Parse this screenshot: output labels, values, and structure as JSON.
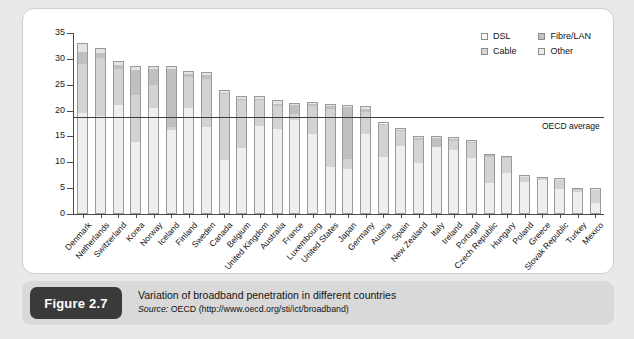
{
  "figure": {
    "badge": "Figure 2.7",
    "caption": "Variation of broadband penetration in different countries",
    "source_prefix": "Source: ",
    "source_text": "OECD (http://www.oecd.org/sti/ict/broadband)"
  },
  "legend": {
    "position": "top-right",
    "items": [
      {
        "label": "DSL",
        "key": "dsl",
        "color": "#fafafa"
      },
      {
        "label": "Fibre/LAN",
        "key": "fibre",
        "color": "#c2c2c2"
      },
      {
        "label": "Cable",
        "key": "cable",
        "color": "#d6d6d6"
      },
      {
        "label": "Other",
        "key": "other",
        "color": "#ededed"
      }
    ]
  },
  "annotations": {
    "oecd_average_label": "OECD average",
    "oecd_average_value": 18.7
  },
  "chart_data": {
    "type": "bar",
    "title": "Variation of broadband penetration in different countries",
    "subtitle": "Source: OECD (http://www.oecd.org/sti/ict/broadband)",
    "xlabel": "",
    "ylabel": "",
    "ylim": [
      0,
      35
    ],
    "yticks": [
      0,
      5,
      10,
      15,
      20,
      25,
      30,
      35
    ],
    "ytick_labels": [
      "0",
      "5",
      "10",
      "15",
      "20",
      "25",
      "30",
      "35"
    ],
    "grid": false,
    "stacked": true,
    "legend_position": "top-right",
    "categories": [
      "Denmark",
      "Netherlands",
      "Switzerland",
      "Korea",
      "Norway",
      "Iceland",
      "Finland",
      "Sweden",
      "Canada",
      "Belgium",
      "United Kingdom",
      "Australia",
      "France",
      "Luxembourg",
      "United States",
      "Japan",
      "Germany",
      "Austria",
      "Spain",
      "New Zealand",
      "Italy",
      "Ireland",
      "Portugal",
      "Czech Republic",
      "Hungary",
      "Poland",
      "Greece",
      "Slovak Republic",
      "Turkey",
      "Mexico"
    ],
    "values": [
      33.0,
      32.1,
      29.6,
      28.6,
      28.7,
      28.7,
      27.7,
      27.4,
      23.9,
      22.8,
      22.8,
      22.0,
      21.5,
      21.7,
      21.3,
      21.0,
      20.8,
      17.7,
      16.6,
      15.1,
      15.0,
      14.9,
      14.3,
      11.7,
      11.3,
      7.5,
      7.2,
      6.9,
      5.1,
      5.0
    ],
    "series": [
      {
        "name": "DSL",
        "values": [
          19.5,
          19.0,
          21.2,
          14.0,
          20.5,
          16.2,
          20.6,
          16.8,
          10.5,
          12.8,
          17.1,
          16.5,
          18.3,
          15.5,
          9.0,
          8.6,
          15.6,
          11.1,
          13.3,
          9.9,
          13.1,
          12.6,
          11.0,
          6.1,
          8.0,
          6.4,
          6.8,
          5.0,
          4.4,
          2.2
        ]
      },
      {
        "name": "Cable",
        "values": [
          9.6,
          11.4,
          7.0,
          9.1,
          4.6,
          0.6,
          6.0,
          9.4,
          12.9,
          9.4,
          5.2,
          4.5,
          1.2,
          5.6,
          11.5,
          2.1,
          4.4,
          6.3,
          2.9,
          4.6,
          0.0,
          1.7,
          3.0,
          5.2,
          3.0,
          0.9,
          0.3,
          1.7,
          0.4,
          2.7
        ]
      },
      {
        "name": "Fibre/LAN",
        "values": [
          2.4,
          1.0,
          0.8,
          5.0,
          3.1,
          11.5,
          0.7,
          0.9,
          0.2,
          0.3,
          0.1,
          0.4,
          1.8,
          0.4,
          0.5,
          10.1,
          0.4,
          0.2,
          0.3,
          0.3,
          1.7,
          0.4,
          0.2,
          0.3,
          0.2,
          0.1,
          0.0,
          0.1,
          0.2,
          0.0
        ]
      },
      {
        "name": "Other",
        "values": [
          1.5,
          0.7,
          0.6,
          0.5,
          0.5,
          0.4,
          0.4,
          0.3,
          0.3,
          0.3,
          0.4,
          0.6,
          0.2,
          0.2,
          0.3,
          0.2,
          0.4,
          0.1,
          0.1,
          0.3,
          0.2,
          0.2,
          0.1,
          0.1,
          0.1,
          0.1,
          0.1,
          0.1,
          0.1,
          0.1
        ]
      }
    ],
    "reference_line": {
      "label": "OECD average",
      "value": 18.7
    }
  }
}
